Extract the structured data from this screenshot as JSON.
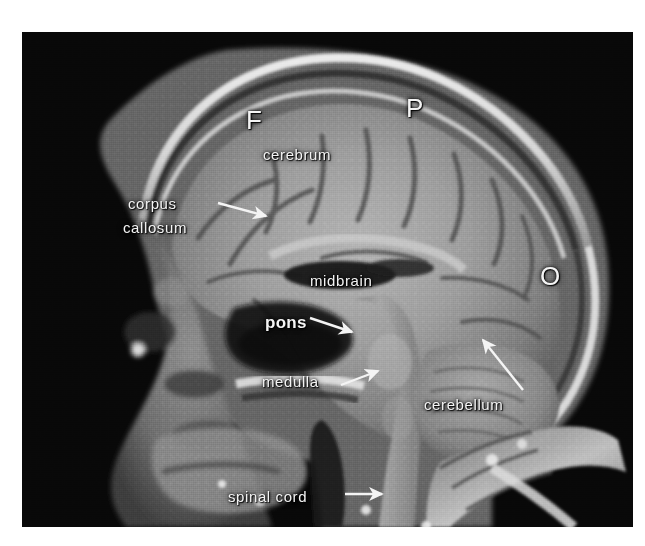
{
  "figure": {
    "kind": "sagittal-mri-brain-scan",
    "modality": "MRI",
    "plane": "midsagittal",
    "panel": {
      "background_color": "#050505",
      "border_color": "#ffffff"
    },
    "label_color": "#f4f4f4"
  },
  "labels": [
    {
      "id": "frontal-lobe",
      "text": "F",
      "style": "letter",
      "x": 246,
      "y": 106
    },
    {
      "id": "parietal-lobe",
      "text": "P",
      "style": "letter",
      "x": 406,
      "y": 94
    },
    {
      "id": "occipital-lobe",
      "text": "O",
      "style": "letter",
      "x": 540,
      "y": 262
    },
    {
      "id": "cerebrum",
      "text": "cerebrum",
      "style": "plain",
      "x": 263,
      "y": 146
    },
    {
      "id": "corpus-callosum-line1",
      "text": "corpus",
      "style": "plain",
      "x": 128,
      "y": 195
    },
    {
      "id": "corpus-callosum-line2",
      "text": "callosum",
      "style": "plain",
      "x": 123,
      "y": 219
    },
    {
      "id": "midbrain",
      "text": "midbrain",
      "style": "plain",
      "x": 310,
      "y": 272
    },
    {
      "id": "pons",
      "text": "pons",
      "style": "bold",
      "x": 265,
      "y": 314
    },
    {
      "id": "medulla",
      "text": "medulla",
      "style": "plain",
      "x": 262,
      "y": 373
    },
    {
      "id": "cerebellum",
      "text": "cerebellum",
      "style": "plain",
      "x": 424,
      "y": 396
    },
    {
      "id": "spinal-cord",
      "text": "spinal cord",
      "style": "plain",
      "x": 228,
      "y": 488
    }
  ],
  "pointers": [
    {
      "id": "corpus-callosum-arrow",
      "from": [
        218,
        203
      ],
      "to": [
        266,
        216
      ],
      "head": "right-down"
    },
    {
      "id": "pons-arrow",
      "from": [
        310,
        318
      ],
      "to": [
        352,
        332
      ],
      "head": "right-down"
    },
    {
      "id": "medulla-arrow",
      "from": [
        341,
        385
      ],
      "to": [
        378,
        371
      ],
      "head": "right-up"
    },
    {
      "id": "cerebellum-arrow",
      "from": [
        523,
        390
      ],
      "to": [
        483,
        340
      ],
      "head": "left-up"
    },
    {
      "id": "spinal-cord-arrow",
      "from": [
        345,
        494
      ],
      "to": [
        382,
        494
      ],
      "head": "right"
    }
  ],
  "anatomy_regions": [
    {
      "id": "scalp-fat-line",
      "description": "bright subcutaneous fat outlining the calvarium"
    },
    {
      "id": "skull-bone",
      "description": "dark diploic bone beneath the scalp"
    },
    {
      "id": "cerebral-cortex",
      "description": "gyral gray matter of the cerebral hemisphere"
    },
    {
      "id": "corpus-callosum",
      "description": "arched white matter commissure above the ventricle"
    },
    {
      "id": "lateral-ventricle",
      "description": "dark CSF space under the corpus callosum"
    },
    {
      "id": "brainstem",
      "description": "midbrain, pons and medulla column"
    },
    {
      "id": "cerebellum",
      "description": "foliated posterior fossa structure"
    },
    {
      "id": "spinal-cord",
      "description": "cord continuing into the cervical canal"
    },
    {
      "id": "face-sinuses",
      "description": "anterior facial soft tissue and sinuses"
    },
    {
      "id": "cervical-spine",
      "description": "bright vertebral bodies of the neck"
    }
  ]
}
